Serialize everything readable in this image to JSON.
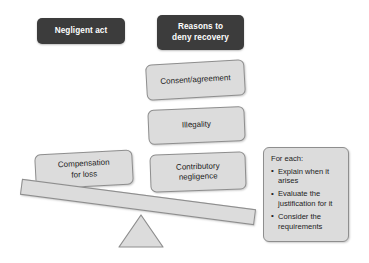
{
  "diagram": {
    "title_nodes": [
      {
        "id": "negligent-act",
        "label": "Negligent act"
      },
      {
        "id": "reasons-to-deny-recovery",
        "label": "Reasons to\ndeny recovery"
      }
    ],
    "left_pan": {
      "label": "Compensation\nfor loss"
    },
    "right_pan_stack": [
      {
        "id": "consent-agreement",
        "label": "Consent/agreement"
      },
      {
        "id": "illegality",
        "label": "Illegality"
      },
      {
        "id": "contributory-negligence",
        "label": "Contributory\nnegligence"
      }
    ],
    "side_panel": {
      "title": "For each:",
      "items": [
        "Explain when it arises",
        "Evaluate the justification for it",
        "Consider the requirements"
      ]
    },
    "colors": {
      "dark_box": "#3c3c3c",
      "dark_box_text": "#ffffff",
      "grey_box": "#dcdcdc",
      "grey_box_border": "#8e8e8e",
      "grey_box_text": "#222222",
      "background": "#ffffff"
    }
  }
}
